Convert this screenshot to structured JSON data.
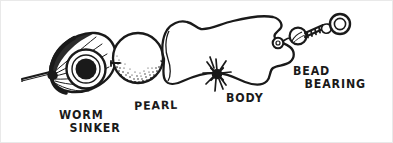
{
  "figure": {
    "style": "pen-and-ink line drawing",
    "ink_color": "#1a1a1a",
    "background_color": "#ffffff"
  },
  "labels": {
    "worm_sinker": {
      "line1": "WORM",
      "line2": "SINKER"
    },
    "pearl": {
      "line1": "PEARL"
    },
    "body": {
      "line1": "BODY"
    },
    "bead_bearing": {
      "line1": "BEAD",
      "line2": "BEARING"
    }
  },
  "parts": [
    {
      "name": "fishing-line",
      "label": ""
    },
    {
      "name": "worm-sinker",
      "label": "WORM SINKER"
    },
    {
      "name": "pearl-bead",
      "label": "PEARL"
    },
    {
      "name": "wire-loop-eye",
      "label": ""
    },
    {
      "name": "lure-body",
      "label": "BODY"
    },
    {
      "name": "sparkle-mark",
      "label": ""
    },
    {
      "name": "bead-bearing-swivel",
      "label": "BEAD BEARING"
    }
  ]
}
